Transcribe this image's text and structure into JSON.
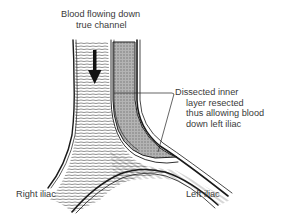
{
  "diagram": {
    "labels": {
      "flow": {
        "line1": "Blood flowing down",
        "line2": "true channel"
      },
      "dissection": {
        "line1": "Dissected inner",
        "line2": "layer resected",
        "line3": "thus allowing blood",
        "line4": "down left iliac"
      },
      "right_iliac": "Right iliac",
      "left_iliac": "Left iliac"
    },
    "colors": {
      "outline": "#1a1a1a",
      "false_lumen_fill": "#a8a8a8",
      "hatching": "#555555",
      "text": "#3a3a3a",
      "background": "#ffffff"
    },
    "icons": {
      "flow_arrow": "down-arrow-icon"
    }
  }
}
